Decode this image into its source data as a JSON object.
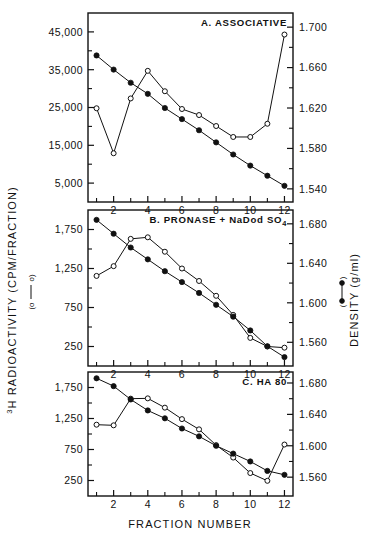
{
  "figure": {
    "xlabel": "FRACTION NUMBER",
    "ylabel_left": "H RADIOACTIVITY (CPM/FRACTION)",
    "ylabel_left_sup": "3",
    "ylabel_right": "DENSITY (g/ml)",
    "legend_left_symbol": "(o——o)",
    "legend_right_symbol": "(•——•)",
    "ink": "#111111",
    "background": "#ffffff"
  },
  "chart_data": [
    {
      "type": "line",
      "panel": "A",
      "title": "A. ASSOCIATIVE",
      "xlabel": "FRACTION NUMBER",
      "x": [
        1,
        2,
        3,
        4,
        5,
        6,
        7,
        8,
        9,
        10,
        11,
        12
      ],
      "xlim": [
        0.5,
        12.5
      ],
      "xticks": [
        1,
        2,
        3,
        4,
        5,
        6,
        7,
        8,
        9,
        10,
        11,
        12
      ],
      "xticklabels": [
        "",
        "2",
        "",
        "4",
        "",
        "6",
        "",
        "8",
        "",
        "10",
        "",
        "12"
      ],
      "grid": false,
      "legend_position": "outside-left-and-right-axis-titles",
      "series": [
        {
          "name": "3H RADIOACTIVITY (CPM/FRACTION)",
          "marker": "open-circle",
          "axis": "left",
          "ylabel": "H RADIOACTIVITY (CPM/FRACTION)",
          "ylim": [
            0,
            50000
          ],
          "yticks": [
            5000,
            15000,
            25000,
            35000,
            45000
          ],
          "yticklabels": [
            "5,000",
            "15,000",
            "25,000",
            "35,000",
            "45,000"
          ],
          "values": [
            24800,
            12900,
            27400,
            34700,
            29300,
            24600,
            23000,
            20100,
            17200,
            17200,
            20700,
            44300
          ]
        },
        {
          "name": "DENSITY (g/ml)",
          "marker": "filled-circle",
          "axis": "right",
          "ylabel": "DENSITY (g/ml)",
          "ylim": [
            1.527,
            1.714
          ],
          "yticks": [
            1.54,
            1.58,
            1.62,
            1.66,
            1.7
          ],
          "yticklabels": [
            "1.540",
            "1.580",
            "1.620",
            "1.660",
            "1.700"
          ],
          "values": [
            1.672,
            1.658,
            1.645,
            1.634,
            1.62,
            1.609,
            1.598,
            1.586,
            1.574,
            1.563,
            1.553,
            1.543
          ]
        }
      ]
    },
    {
      "type": "line",
      "panel": "B",
      "title": "B. PRONASE + NaDod SO4",
      "title_sub": "4",
      "xlabel": "FRACTION NUMBER",
      "x": [
        1,
        2,
        3,
        4,
        5,
        6,
        7,
        8,
        9,
        10,
        11,
        12
      ],
      "xlim": [
        0.5,
        12.5
      ],
      "xticks": [
        1,
        2,
        3,
        4,
        5,
        6,
        7,
        8,
        9,
        10,
        11,
        12
      ],
      "xticklabels": [
        "",
        "2",
        "",
        "4",
        "",
        "6",
        "",
        "8",
        "",
        "10",
        "",
        "12"
      ],
      "grid": false,
      "legend_position": "outside-left-and-right-axis-titles",
      "series": [
        {
          "name": "3H RADIOACTIVITY (CPM/FRACTION)",
          "marker": "open-circle",
          "axis": "left",
          "ylabel": "H RADIOACTIVITY (CPM/FRACTION)",
          "ylim": [
            0,
            2000
          ],
          "yticks": [
            250,
            750,
            1250,
            1750
          ],
          "yticklabels": [
            "250",
            "750",
            "1,250",
            "1,750"
          ],
          "values": [
            1155,
            1280,
            1630,
            1650,
            1465,
            1250,
            1090,
            900,
            655,
            360,
            250,
            235
          ]
        },
        {
          "name": "DENSITY (g/ml)",
          "marker": "filled-circle",
          "axis": "right",
          "ylabel": "DENSITY (g/ml)",
          "ylim": [
            1.536,
            1.694
          ],
          "yticks": [
            1.56,
            1.6,
            1.64,
            1.68
          ],
          "yticklabels": [
            "1.560",
            "1.600",
            "1.640",
            "1.680"
          ],
          "values": [
            1.684,
            1.67,
            1.656,
            1.644,
            1.632,
            1.621,
            1.61,
            1.598,
            1.586,
            1.572,
            1.556,
            1.545
          ]
        }
      ]
    },
    {
      "type": "line",
      "panel": "C",
      "title": "C. HA 80",
      "xlabel": "FRACTION NUMBER",
      "x": [
        1,
        2,
        3,
        4,
        5,
        6,
        7,
        8,
        9,
        10,
        11,
        12
      ],
      "xlim": [
        0.5,
        12.5
      ],
      "xticks": [
        1,
        2,
        3,
        4,
        5,
        6,
        7,
        8,
        9,
        10,
        11,
        12
      ],
      "xticklabels": [
        "",
        "2",
        "",
        "4",
        "",
        "6",
        "",
        "8",
        "",
        "10",
        "",
        "12"
      ],
      "grid": false,
      "legend_position": "outside-left-and-right-axis-titles",
      "series": [
        {
          "name": "3H RADIOACTIVITY (CPM/FRACTION)",
          "marker": "open-circle",
          "axis": "left",
          "ylabel": "H RADIOACTIVITY (CPM/FRACTION)",
          "ylim": [
            0,
            2000
          ],
          "yticks": [
            250,
            750,
            1250,
            1750
          ],
          "yticklabels": [
            "250",
            "750",
            "1,250",
            "1,750"
          ],
          "values": [
            1150,
            1140,
            1570,
            1575,
            1425,
            1240,
            1075,
            820,
            620,
            370,
            245,
            830
          ]
        },
        {
          "name": "DENSITY (g/ml)",
          "marker": "filled-circle",
          "axis": "right",
          "ylabel": "DENSITY (g/ml)",
          "ylim": [
            1.536,
            1.694
          ],
          "yticks": [
            1.56,
            1.6,
            1.64,
            1.68
          ],
          "yticklabels": [
            "1.560",
            "1.600",
            "1.640",
            "1.680"
          ],
          "values": [
            1.686,
            1.676,
            1.659,
            1.645,
            1.635,
            1.622,
            1.612,
            1.6,
            1.59,
            1.58,
            1.568,
            1.563
          ]
        }
      ]
    }
  ]
}
